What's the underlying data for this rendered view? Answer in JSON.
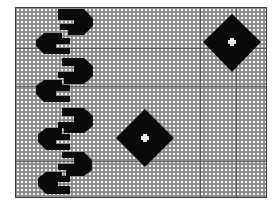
{
  "figure": {
    "colors": {
      "ground": "#8a8a8a",
      "stitch_light": "#f2f2f2",
      "motif": "#0a0a0a",
      "grid_line": "#444444"
    },
    "grid_lines": {
      "vertical_x": [
        200,
        236
      ],
      "horizontal_y": [
        47,
        85,
        160
      ]
    },
    "motifs": [
      {
        "type": "hook-column",
        "count": 5,
        "position": "left"
      },
      {
        "type": "diamond",
        "center": [
          232,
          42
        ],
        "hole": "cross"
      },
      {
        "type": "diamond",
        "center": [
          145,
          138
        ],
        "hole": "cross"
      }
    ]
  }
}
